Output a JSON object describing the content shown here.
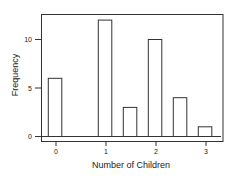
{
  "chart_data": {
    "type": "bar",
    "title": "",
    "xlabel": "Number of Children",
    "ylabel": "Frequency",
    "x": [
      0,
      1,
      1.5,
      2,
      2.5,
      3
    ],
    "categories": [
      "0",
      "1",
      "1.5",
      "2",
      "2.5",
      "3"
    ],
    "values": [
      6,
      12,
      3,
      10,
      4,
      1
    ],
    "xticks": [
      0,
      1,
      2,
      3
    ],
    "xtick_labels": [
      "0",
      "1",
      "2",
      "3"
    ],
    "yticks": [
      0,
      5,
      10
    ],
    "ytick_labels": [
      "0",
      "5",
      "10"
    ],
    "xlim": [
      -0.3,
      3.35
    ],
    "ylim": [
      0,
      12.5
    ],
    "grid": false,
    "legend": null,
    "bar_fill": "#ffffff",
    "bar_stroke": "#333333"
  }
}
